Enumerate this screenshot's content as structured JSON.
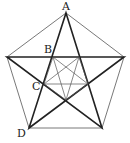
{
  "diagram": {
    "type": "geometry",
    "labels": [
      {
        "id": "A",
        "text": "A",
        "x": 66,
        "y": 9
      },
      {
        "id": "B",
        "text": "B",
        "x": 47,
        "y": 52
      },
      {
        "id": "C",
        "text": "C",
        "x": 34,
        "y": 88
      },
      {
        "id": "D",
        "text": "D",
        "x": 20,
        "y": 136
      }
    ],
    "outer_pentagon": [
      [
        66,
        13
      ],
      [
        124,
        57
      ],
      [
        102,
        128
      ],
      [
        29,
        128
      ],
      [
        7,
        57
      ]
    ],
    "inner_pentagon": [
      [
        53,
        57
      ],
      [
        79,
        57
      ],
      [
        88,
        84
      ],
      [
        66,
        100
      ],
      [
        44,
        84
      ]
    ],
    "colors": {
      "stroke": "#333333",
      "background": "#ffffff"
    }
  }
}
